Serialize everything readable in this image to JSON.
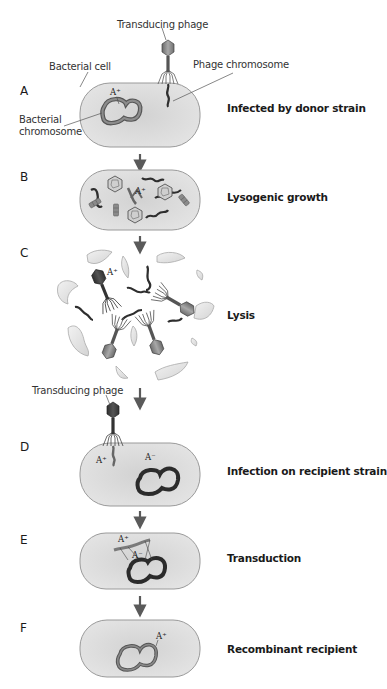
{
  "diagram": {
    "type": "process-flow",
    "colors": {
      "cell_fill": "#dcdcdc",
      "cell_stroke": "#9a9a9a",
      "donor_chromosome": "#7a7a7a",
      "recipient_chromosome": "#2b2b2b",
      "phage_dna": "#2e2e2e",
      "arrow": "#5a5a5a",
      "debris": "#e6e6e6"
    },
    "steps": [
      {
        "letter": "A",
        "caption": "Infected by donor strain",
        "labels": {
          "phage": "Transducing phage",
          "cell": "Bacterial cell",
          "phage_chromosome": "Phage chromosome",
          "bacterial_chromosome_line1": "Bacterial",
          "bacterial_chromosome_line2": "chromosome",
          "allele": "A⁺"
        }
      },
      {
        "letter": "B",
        "caption": "Lysogenic growth",
        "labels": {
          "allele": "A⁺"
        }
      },
      {
        "letter": "C",
        "caption": "Lysis",
        "labels": {
          "allele": "A⁺"
        }
      },
      {
        "letter": "D",
        "caption": "Infection on recipient strain",
        "labels": {
          "phage": "Transducing phage",
          "donor_allele": "A⁺",
          "recipient_allele": "A⁻"
        }
      },
      {
        "letter": "E",
        "caption": "Transduction",
        "labels": {
          "donor_allele": "A⁺",
          "recipient_allele": "A⁻"
        }
      },
      {
        "letter": "F",
        "caption": "Recombinant recipient",
        "labels": {
          "allele": "A⁺"
        }
      }
    ]
  }
}
